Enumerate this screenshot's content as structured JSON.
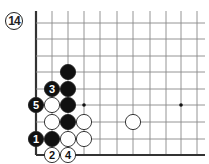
{
  "diagram": {
    "number": "14",
    "grid": {
      "x_lines": [
        36,
        52,
        68,
        84,
        100,
        117,
        133,
        150,
        166,
        181,
        197
      ],
      "y_lines": [
        23,
        39,
        56,
        72,
        89,
        105,
        122,
        139,
        155
      ],
      "top": 11,
      "right": 205,
      "left_edge_x": 36,
      "bottom_edge_y": 155,
      "line_color": "#888888",
      "edge_color": "#333333"
    },
    "star_points": [
      {
        "x": 84,
        "y": 105
      },
      {
        "x": 181,
        "y": 105
      }
    ],
    "stones": [
      {
        "color": "black",
        "x": 68,
        "y": 72,
        "label": ""
      },
      {
        "color": "black",
        "x": 52,
        "y": 89,
        "label": "3"
      },
      {
        "color": "black",
        "x": 68,
        "y": 89,
        "label": ""
      },
      {
        "color": "black",
        "x": 36,
        "y": 105,
        "label": "5"
      },
      {
        "color": "white",
        "x": 52,
        "y": 105,
        "label": ""
      },
      {
        "color": "black",
        "x": 68,
        "y": 105,
        "label": ""
      },
      {
        "color": "white",
        "x": 52,
        "y": 122,
        "label": ""
      },
      {
        "color": "black",
        "x": 68,
        "y": 122,
        "label": ""
      },
      {
        "color": "white",
        "x": 84,
        "y": 122,
        "label": ""
      },
      {
        "color": "black",
        "x": 36,
        "y": 139,
        "label": "1"
      },
      {
        "color": "black",
        "x": 52,
        "y": 139,
        "label": ""
      },
      {
        "color": "white",
        "x": 68,
        "y": 139,
        "label": ""
      },
      {
        "color": "white",
        "x": 84,
        "y": 139,
        "label": ""
      },
      {
        "color": "white",
        "x": 52,
        "y": 155,
        "label": "2"
      },
      {
        "color": "white",
        "x": 68,
        "y": 155,
        "label": "4"
      },
      {
        "color": "white",
        "x": 133,
        "y": 122,
        "label": ""
      }
    ],
    "stone_radius": 7.6,
    "colors": {
      "black_stone": "#111111",
      "white_stone": "#ffffff",
      "stone_outline": "#222222"
    }
  }
}
